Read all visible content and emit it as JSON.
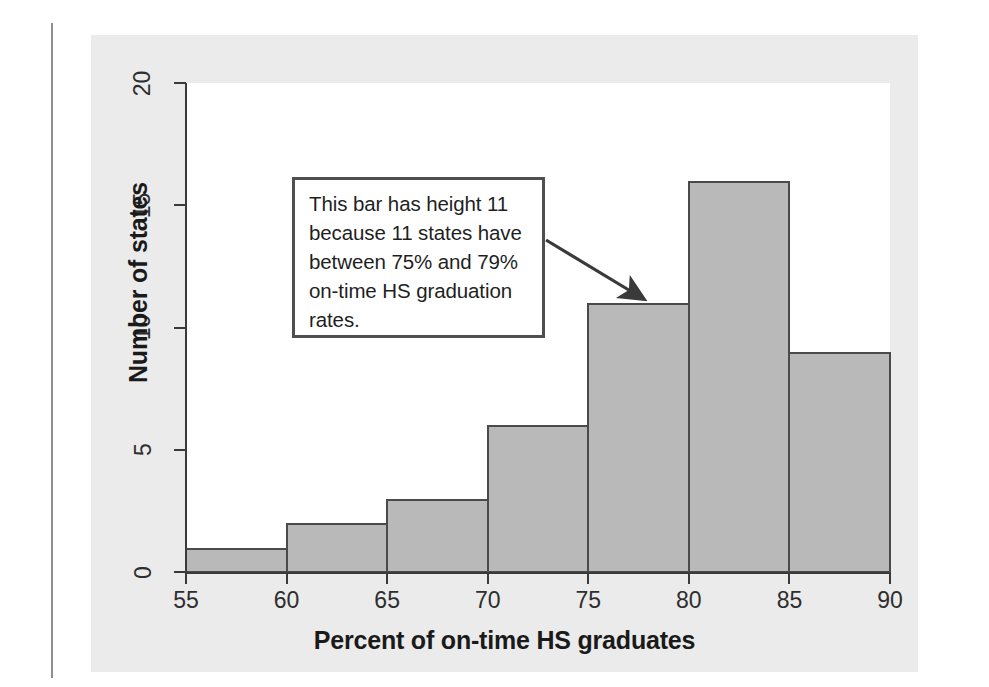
{
  "figure": {
    "panel_bg": "#ebebeb",
    "plot_bg": "#ffffff",
    "bar_fill": "#b9b9b9",
    "bar_stroke": "#4a4a4a",
    "axis_color": "#3a3a3a",
    "annotation_border": "#4f4f4f"
  },
  "annotation": {
    "text": "This bar has height 11 because 11 states have between 75% and 79% on-time HS graduation rates.",
    "lines": "This bar has height 11\nbecause 11 states have\nbetween 75% and 79%\non-time HS graduation\nrates.",
    "points_to_bin": "75-80",
    "points_to_value": 11
  },
  "chart_data": {
    "type": "bar",
    "subtype": "histogram",
    "title": "",
    "xlabel": "Percent of on-time HS graduates",
    "ylabel": "Number of states",
    "xlim": [
      55,
      90
    ],
    "ylim": [
      0,
      20
    ],
    "bin_width": 5,
    "grid": false,
    "legend": null,
    "x_ticks": [
      55,
      60,
      65,
      70,
      75,
      80,
      85,
      90
    ],
    "x_tick_labels": [
      "55",
      "60",
      "65",
      "70",
      "75",
      "80",
      "85",
      "90"
    ],
    "y_ticks": [
      0,
      5,
      10,
      15,
      20
    ],
    "y_tick_labels": [
      "0",
      "5",
      "10",
      "15",
      "20"
    ],
    "bin_edges": [
      55,
      60,
      65,
      70,
      75,
      80,
      85,
      90
    ],
    "categories": [
      "55-60",
      "60-65",
      "65-70",
      "70-75",
      "75-80",
      "80-85",
      "85-90"
    ],
    "values": [
      1,
      2,
      3,
      6,
      11,
      16,
      9
    ],
    "annotations": [
      {
        "text": "This bar has height 11 because 11 states have between 75% and 79% on-time HS graduation rates.",
        "target_bin": "75-80",
        "target_value": 11
      }
    ]
  }
}
